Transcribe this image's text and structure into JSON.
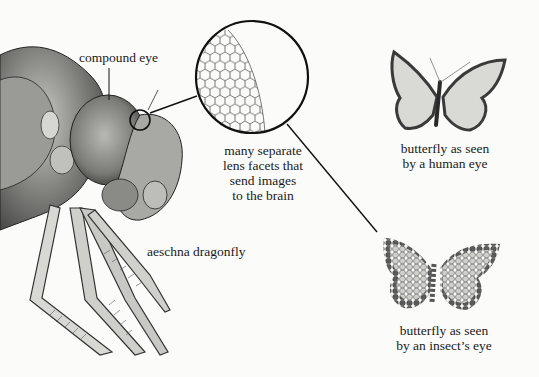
{
  "diagram": {
    "labels": {
      "compound_eye": "compound eye",
      "lens_facets": [
        "many separate",
        "lens facets that",
        "send images",
        "to the brain"
      ],
      "dragonfly": "aeschna dragonfly",
      "human_view": [
        "butterfly as seen",
        "by a human eye"
      ],
      "insect_view": [
        "butterfly as seen",
        "by an insect’s eye"
      ]
    },
    "figures": [
      {
        "name": "dragonfly-head-illustration",
        "description": "detailed grayscale drawing of a dragonfly head with compound eye and spiny legs"
      },
      {
        "name": "magnified-facets-circle",
        "description": "circular magnification showing hexagonal lens facets"
      },
      {
        "name": "butterfly-human-view",
        "description": "smooth grayscale butterfly"
      },
      {
        "name": "butterfly-insect-view",
        "description": "butterfly rendered as mosaic of hexagonal dots"
      }
    ],
    "colors": {
      "background": "#fbfbf9",
      "ink": "#1a1a1a",
      "wing_light": "#d9d9d6",
      "wing_dark": "#3a3a3a"
    }
  }
}
